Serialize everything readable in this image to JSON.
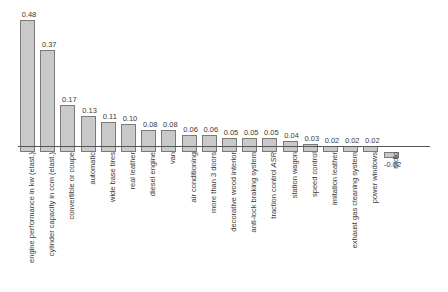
{
  "chart_data": {
    "type": "bar",
    "title": "",
    "subtitle": "",
    "xlabel": "",
    "ylabel": "",
    "ylim": [
      -0.05,
      0.52
    ],
    "grid": false,
    "legend": null,
    "orientation": "vertical",
    "value_labels_shown": true,
    "categories": [
      "engine performance in kw (elast.)",
      "cylinder capacity in ccm (elast.)",
      "convertible or coupe",
      "automatic",
      "wide base tires",
      "real leather",
      "diesel engine",
      "van",
      "air conditioning",
      "more than 3 doors",
      "decorative wood interior",
      "anti-lock braking system",
      "traction control ASR",
      "station wagon",
      "speed control",
      "imitation leather",
      "exhaust gas cleaning system",
      "power windows",
      "radio"
    ],
    "values": [
      0.48,
      0.37,
      0.17,
      0.13,
      0.11,
      0.1,
      0.08,
      0.08,
      0.06,
      0.06,
      0.05,
      0.05,
      0.05,
      0.04,
      0.03,
      0.02,
      0.02,
      0.02,
      -0.02
    ],
    "value_labels": [
      "0.48",
      "0.37",
      "0.17",
      "0.13",
      "0.11",
      "0.10",
      "0.08",
      "0.08",
      "0.06",
      "0.06",
      "0.05",
      "0.05",
      "0.05",
      "0.04",
      "0.03",
      "0.02",
      "0.02",
      "0.02",
      "-0.02"
    ]
  },
  "style": {
    "bar_fill": "#c9c9c9",
    "bar_stroke": "#7a7a7a",
    "axis_color": "#555555",
    "text_color": "#3a3a3a",
    "background": "#ffffff"
  }
}
